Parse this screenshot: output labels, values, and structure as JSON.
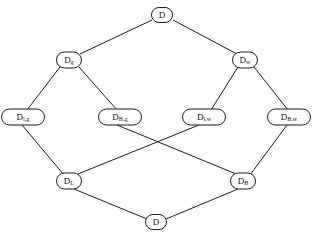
{
  "diagram": {
    "type": "hasse-lattice",
    "line_color": "#1b1b1b",
    "node_fill": "#ffffff",
    "background": "#ffffff",
    "nodes": [
      {
        "id": "top",
        "base": "D",
        "sub": "",
        "label": "D",
        "x": 162,
        "y": 15,
        "w": 21,
        "h": 15
      },
      {
        "id": "dg",
        "base": "D",
        "sub": "g",
        "label": "Dg",
        "x": 69,
        "y": 60,
        "w": 25,
        "h": 16
      },
      {
        "id": "dw",
        "base": "D",
        "sub": "w",
        "label": "Dw",
        "x": 245,
        "y": 60,
        "w": 25,
        "h": 16
      },
      {
        "id": "dlg",
        "base": "D",
        "sub": "l,g",
        "label": "Dl,g",
        "x": 23,
        "y": 117,
        "w": 43,
        "h": 16
      },
      {
        "id": "dbg",
        "base": "D",
        "sub": "B,g",
        "label": "DB,g",
        "x": 120,
        "y": 117,
        "w": 43,
        "h": 16
      },
      {
        "id": "dlw",
        "base": "D",
        "sub": "l,w",
        "label": "Dl,w",
        "x": 204,
        "y": 117,
        "w": 43,
        "h": 16
      },
      {
        "id": "dbw",
        "base": "D",
        "sub": "B,w",
        "label": "DB,w",
        "x": 289,
        "y": 117,
        "w": 43,
        "h": 16
      },
      {
        "id": "dl",
        "base": "D",
        "sub": "L",
        "label": "DL",
        "x": 69,
        "y": 181,
        "w": 25,
        "h": 16
      },
      {
        "id": "db",
        "base": "D",
        "sub": "B",
        "label": "DB",
        "x": 243,
        "y": 181,
        "w": 25,
        "h": 16
      },
      {
        "id": "bot",
        "base": "D",
        "sub": "",
        "label": "D",
        "x": 156,
        "y": 222,
        "w": 21,
        "h": 15
      }
    ],
    "edges": [
      {
        "from": "top",
        "to": "dg",
        "x1": 152,
        "y1": 20,
        "x2": 80,
        "y2": 54
      },
      {
        "from": "top",
        "to": "dw",
        "x1": 173,
        "y1": 20,
        "x2": 237,
        "y2": 54
      },
      {
        "from": "dg",
        "to": "dlg",
        "x1": 60,
        "y1": 67,
        "x2": 27,
        "y2": 110
      },
      {
        "from": "dg",
        "to": "dbg",
        "x1": 79,
        "y1": 67,
        "x2": 117,
        "y2": 110
      },
      {
        "from": "dw",
        "to": "dlw",
        "x1": 238,
        "y1": 67,
        "x2": 211,
        "y2": 110
      },
      {
        "from": "dw",
        "to": "dbw",
        "x1": 254,
        "y1": 67,
        "x2": 288,
        "y2": 110
      },
      {
        "from": "dlg",
        "to": "dl",
        "x1": 22,
        "y1": 125,
        "x2": 64,
        "y2": 175
      },
      {
        "from": "dbg",
        "to": "db",
        "x1": 117,
        "y1": 125,
        "x2": 241,
        "y2": 176
      },
      {
        "from": "dlw",
        "to": "dl",
        "x1": 199,
        "y1": 125,
        "x2": 73,
        "y2": 176
      },
      {
        "from": "dbw",
        "to": "db",
        "x1": 287,
        "y1": 125,
        "x2": 250,
        "y2": 175
      },
      {
        "from": "dl",
        "to": "bot",
        "x1": 74,
        "y1": 189,
        "x2": 147,
        "y2": 219
      },
      {
        "from": "db",
        "to": "bot",
        "x1": 238,
        "y1": 189,
        "x2": 166,
        "y2": 219
      }
    ]
  }
}
